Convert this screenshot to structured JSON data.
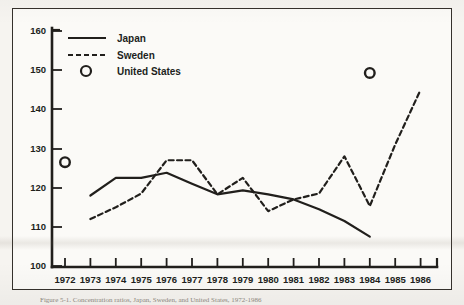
{
  "figure": {
    "background_color": "#fbfaf7",
    "ink_color": "#211f1c"
  },
  "caption": {
    "text": "Figure 5-1. Concentration ratios, Japan, Sweden, and United States, 1972-1986"
  },
  "legend": {
    "position": "top-left-inside",
    "entries": [
      {
        "label": "Japan",
        "marker": "solid-line"
      },
      {
        "label": "Sweden",
        "marker": "dashed-line"
      },
      {
        "label": "United States",
        "marker": "open-circle"
      }
    ]
  },
  "chart_data": {
    "type": "line",
    "title": "",
    "xlabel": "",
    "ylabel": "",
    "ylim": [
      100,
      160
    ],
    "ytick_step": 10,
    "yticks": [
      100,
      110,
      120,
      130,
      140,
      150,
      160
    ],
    "grid": false,
    "x": [
      1972,
      1973,
      1974,
      1975,
      1976,
      1977,
      1978,
      1979,
      1980,
      1981,
      1982,
      1983,
      1984,
      1985,
      1986
    ],
    "xticklabels": [
      "1972",
      "1973",
      "1974",
      "1975",
      "1976",
      "1977",
      "1978",
      "1979",
      "1980",
      "1981",
      "1982",
      "1983",
      "1984",
      "1985",
      "1986"
    ],
    "series": [
      {
        "name": "Japan",
        "style": "solid",
        "x": [
          1973,
          1974,
          1975,
          1976,
          1977,
          1978,
          1979,
          1980,
          1981,
          1982,
          1983,
          1984
        ],
        "values": [
          118.0,
          122.5,
          122.5,
          123.8,
          121.0,
          118.3,
          119.3,
          118.3,
          117.0,
          114.5,
          111.5,
          107.5
        ]
      },
      {
        "name": "Sweden",
        "style": "dashed",
        "x": [
          1973,
          1974,
          1975,
          1976,
          1977,
          1978,
          1979,
          1980,
          1981,
          1982,
          1983,
          1984,
          1985,
          1986
        ],
        "values": [
          112.0,
          115.0,
          118.5,
          127.0,
          127.0,
          118.3,
          122.5,
          114.0,
          117.0,
          118.5,
          128.0,
          115.3,
          131.0,
          145.0
        ]
      },
      {
        "name": "United States",
        "style": "open-circle-markers",
        "x": [
          1972,
          1984
        ],
        "values": [
          126.5,
          149.3
        ]
      }
    ]
  }
}
